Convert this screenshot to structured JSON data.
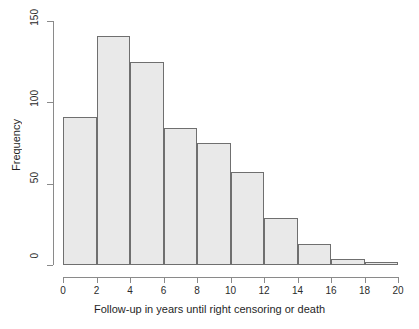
{
  "chart_data": {
    "type": "bar",
    "title": "",
    "subtitle": "",
    "xlabel": "Follow-up in years until right censoring or death",
    "ylabel": "Frequency",
    "xlim": [
      0,
      20
    ],
    "ylim": [
      0,
      150
    ],
    "bin_width": 2,
    "grid": false,
    "legend": false,
    "legend_position": "none",
    "categories": [
      "0-2",
      "2-4",
      "4-6",
      "6-8",
      "8-10",
      "10-12",
      "12-14",
      "14-16",
      "16-18",
      "18-20"
    ],
    "bin_edges": [
      0,
      2,
      4,
      6,
      8,
      10,
      12,
      14,
      16,
      18,
      20
    ],
    "values": [
      91,
      141,
      125,
      84,
      75,
      57,
      29,
      13,
      4,
      2
    ],
    "x_ticks": [
      0,
      2,
      4,
      6,
      8,
      10,
      12,
      14,
      16,
      18,
      20
    ],
    "x_tick_labels": [
      "0",
      "2",
      "4",
      "6",
      "8",
      "10",
      "12",
      "14",
      "16",
      "18",
      "20"
    ],
    "y_ticks": [
      0,
      50,
      100,
      150
    ],
    "y_tick_labels": [
      "0",
      "50",
      "100",
      "150"
    ],
    "bar_fill_color": "#e9e9e9",
    "bar_border_color": "#6f6f6f",
    "axis_color": "#8a8a8a",
    "background_color": "#ffffff"
  }
}
